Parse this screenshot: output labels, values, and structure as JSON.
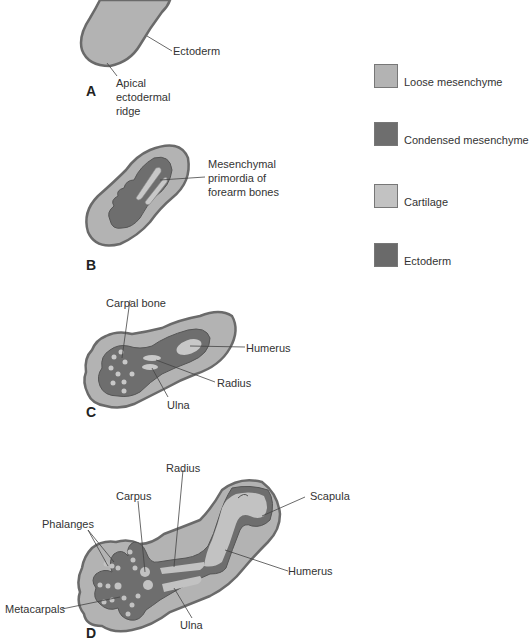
{
  "colors": {
    "loose_mesenchyme": "#b3b3b3",
    "condensed_mesenchyme": "#6e6e6e",
    "cartilage": "#c2c2c2",
    "ectoderm": "#6a6a6a",
    "outline": "#555555",
    "leader": "#444444"
  },
  "legend": [
    {
      "label": "Loose mesenchyme",
      "color": "#b3b3b3"
    },
    {
      "label": "Condensed mesenchyme",
      "color": "#6e6e6e"
    },
    {
      "label": "Cartilage",
      "color": "#c2c2c2"
    },
    {
      "label": "Ectoderm",
      "color": "#6a6a6a"
    }
  ],
  "panels": {
    "A": {
      "letter": "A",
      "labels": {
        "ectoderm": "Ectoderm",
        "aer": "Apical\nectodermal\nridge"
      }
    },
    "B": {
      "letter": "B",
      "labels": {
        "primordia": "Mesenchymal\nprimordia of\nforearm bones"
      }
    },
    "C": {
      "letter": "C",
      "labels": {
        "carpal": "Carpal bone",
        "humerus": "Humerus",
        "radius": "Radius",
        "ulna": "Ulna"
      }
    },
    "D": {
      "letter": "D",
      "labels": {
        "radius": "Radius",
        "carpus": "Carpus",
        "scapula": "Scapula",
        "phalanges": "Phalanges",
        "humerus": "Humerus",
        "metacarpals": "Metacarpals",
        "ulna": "Ulna"
      }
    }
  }
}
